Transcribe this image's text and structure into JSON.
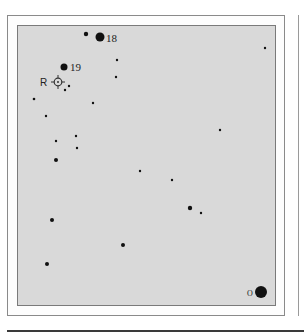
{
  "chart": {
    "title": "",
    "background_color": "#d9d9d9",
    "star_color": "#111111",
    "target": {
      "label": "R",
      "x": 58,
      "y": 82
    },
    "labels": [
      {
        "text": "18",
        "x": 106,
        "y": 42
      },
      {
        "text": "19",
        "x": 70,
        "y": 71
      },
      {
        "text": "O",
        "x": 248,
        "y": 296
      }
    ],
    "stars": [
      {
        "x": 86,
        "y": 34,
        "r": 2.2
      },
      {
        "x": 100,
        "y": 37,
        "r": 4.5
      },
      {
        "x": 64,
        "y": 67,
        "r": 3.5
      },
      {
        "x": 117,
        "y": 60,
        "r": 1.2
      },
      {
        "x": 116,
        "y": 77,
        "r": 1.2
      },
      {
        "x": 265,
        "y": 48,
        "r": 1.2
      },
      {
        "x": 69,
        "y": 86,
        "r": 1.2
      },
      {
        "x": 65,
        "y": 90,
        "r": 1.2
      },
      {
        "x": 34,
        "y": 99,
        "r": 1.3
      },
      {
        "x": 93,
        "y": 103,
        "r": 1.2
      },
      {
        "x": 46,
        "y": 116,
        "r": 1.2
      },
      {
        "x": 220,
        "y": 130,
        "r": 1.2
      },
      {
        "x": 76,
        "y": 136,
        "r": 1.2
      },
      {
        "x": 56,
        "y": 141,
        "r": 1.2
      },
      {
        "x": 77,
        "y": 148,
        "r": 1.2
      },
      {
        "x": 56,
        "y": 160,
        "r": 2.0
      },
      {
        "x": 140,
        "y": 171,
        "r": 1.2
      },
      {
        "x": 172,
        "y": 180,
        "r": 1.2
      },
      {
        "x": 190,
        "y": 208,
        "r": 2.2
      },
      {
        "x": 201,
        "y": 213,
        "r": 1.2
      },
      {
        "x": 52,
        "y": 220,
        "r": 2.0
      },
      {
        "x": 123,
        "y": 245,
        "r": 2.0
      },
      {
        "x": 47,
        "y": 264,
        "r": 2.0
      },
      {
        "x": 261,
        "y": 292,
        "r": 6.0
      }
    ]
  }
}
